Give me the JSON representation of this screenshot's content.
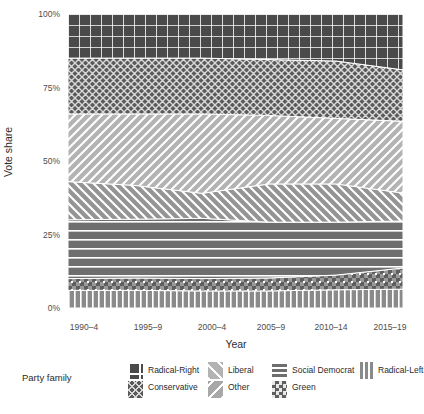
{
  "chart_data": {
    "type": "area",
    "title": "",
    "xlabel": "Year",
    "ylabel": "Vote share",
    "ylim": [
      0,
      100
    ],
    "ytick_labels": [
      "0%",
      "25%",
      "50%",
      "75%",
      "100%"
    ],
    "ytick_values": [
      0,
      25,
      50,
      75,
      100
    ],
    "categories": [
      "1990-4",
      "1995-9",
      "2000-4",
      "2005-9",
      "2010-14",
      "2015-19"
    ],
    "x_values": [
      0,
      1,
      2,
      3,
      4,
      5
    ],
    "grid": false,
    "legend_position": "bottom",
    "legend_title": "Party family",
    "stack_order_bottom_to_top": [
      "Radical-Left",
      "Green",
      "Social Democrat",
      "Other",
      "Liberal",
      "Conservative",
      "Radical-Right"
    ],
    "series": [
      {
        "name": "Radical-Left",
        "pattern": "vertical-stripes",
        "color": "#8a8a8a",
        "values": [
          6.0,
          6.0,
          5.8,
          5.8,
          6.2,
          6.4
        ]
      },
      {
        "name": "Green",
        "pattern": "checkerboard",
        "color": "#9a9a9a",
        "values": [
          4.0,
          4.2,
          4.2,
          4.4,
          5.0,
          7.2
        ]
      },
      {
        "name": "Social Democrat",
        "pattern": "horizontal-stripes",
        "color": "#6e6e6e",
        "values": [
          20.0,
          20.0,
          20.5,
          19.0,
          18.0,
          16.0
        ]
      },
      {
        "name": "Other",
        "pattern": "diagonal-backslash",
        "color": "#949494",
        "values": [
          13.0,
          11.5,
          8.5,
          13.0,
          13.0,
          9.5
        ]
      },
      {
        "name": "Liberal",
        "pattern": "diagonal-slash",
        "color": "#b3b3b3",
        "values": [
          23.0,
          24.3,
          27.0,
          23.3,
          22.3,
          24.4
        ]
      },
      {
        "name": "Conservative",
        "pattern": "zigzag",
        "color": "#5a5a5a",
        "values": [
          19.0,
          19.0,
          19.0,
          19.0,
          19.5,
          17.5
        ]
      },
      {
        "name": "Radical-Right",
        "pattern": "grid",
        "color": "#4a4a4a",
        "values": [
          15.0,
          15.0,
          15.0,
          15.5,
          16.0,
          19.0
        ]
      }
    ],
    "cumulative_top_boundaries": {
      "Radical-Left": [
        6.0,
        6.0,
        5.8,
        5.8,
        6.2,
        6.4
      ],
      "Green": [
        10.0,
        10.2,
        10.0,
        10.2,
        11.2,
        13.6
      ],
      "Social Democrat": [
        30.0,
        30.2,
        30.5,
        29.2,
        29.2,
        29.6
      ],
      "Other": [
        43.0,
        41.7,
        39.0,
        42.2,
        42.2,
        39.1
      ],
      "Liberal": [
        66.0,
        66.0,
        66.0,
        65.5,
        64.5,
        63.5
      ],
      "Conservative": [
        85.0,
        85.0,
        85.0,
        84.5,
        84.0,
        81.0
      ],
      "Radical-Right": [
        100,
        100,
        100,
        100,
        100,
        100
      ]
    }
  },
  "axes": {
    "y_label": "Vote share",
    "x_label": "Year",
    "y_ticks": [
      {
        "label": "100%",
        "value": 100
      },
      {
        "label": "75%",
        "value": 75
      },
      {
        "label": "50%",
        "value": 50
      },
      {
        "label": "25%",
        "value": 25
      },
      {
        "label": "0%",
        "value": 0
      }
    ],
    "x_ticks": [
      {
        "label": "1990–4",
        "value": 0
      },
      {
        "label": "1995–9",
        "value": 1
      },
      {
        "label": "2000–4",
        "value": 2
      },
      {
        "label": "2005–9",
        "value": 3
      },
      {
        "label": "2010–14",
        "value": 4
      },
      {
        "label": "2015–19",
        "value": 5
      }
    ]
  },
  "legend": {
    "title": "Party family",
    "columns": [
      {
        "top": "Radical-Right",
        "bottom": "Conservative"
      },
      {
        "top": "Liberal",
        "bottom": "Other"
      },
      {
        "top": "Social Democrat",
        "bottom": "Green"
      },
      {
        "top": "Radical-Left",
        "bottom": null
      }
    ]
  },
  "colors": {
    "text": "#2b2b2b",
    "tick_text": "#4d4d4d",
    "background": "#ffffff",
    "pattern_line": "#ffffff"
  }
}
